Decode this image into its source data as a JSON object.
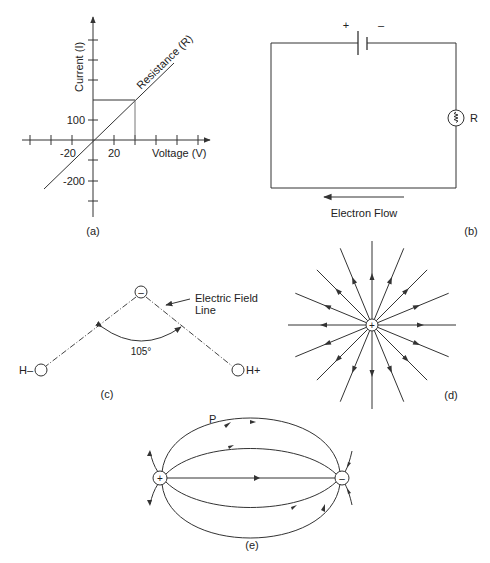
{
  "panels": {
    "a": {
      "caption": "(a)",
      "y_axis_label": "Current (I)",
      "x_axis_label": "Voltage (V)",
      "line_label": "Resistance (R)",
      "x_ticks": [
        "-20",
        "20"
      ],
      "y_ticks": [
        "100",
        "-200"
      ]
    },
    "b": {
      "caption": "(b)",
      "battery_plus": "+",
      "battery_minus": "–",
      "resistor_label": "R",
      "flow_label": "Electron Flow"
    },
    "c": {
      "caption": "(c)",
      "center_charge": "–",
      "left_atom": "H–",
      "right_atom": "H+",
      "angle_label": "105°",
      "callout_line1": "Electric Field",
      "callout_line2": "Line"
    },
    "d": {
      "caption": "(d)",
      "center_charge": "+",
      "field_line_count": 16
    },
    "e": {
      "caption": "(e)",
      "positive_charge": "+",
      "negative_charge": "–",
      "point_label": "P"
    }
  },
  "chart_data": {
    "type": "line",
    "title": "",
    "xlabel": "Voltage (V)",
    "ylabel": "Current (I)",
    "x_tick_labels": [
      "-20",
      "20"
    ],
    "y_tick_labels": [
      "100",
      "-200"
    ],
    "series": [
      {
        "name": "Resistance (R)",
        "x": [
          -30,
          60
        ],
        "y": [
          -150,
          300
        ]
      }
    ],
    "grid": false,
    "annotations": [
      "Resistance (R)"
    ]
  },
  "colors": {
    "ink": "#333333",
    "background": "#ffffff"
  }
}
